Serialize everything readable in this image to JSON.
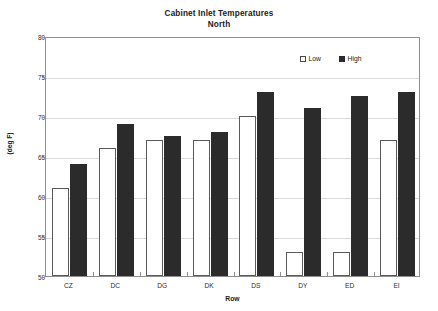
{
  "chart_data": {
    "type": "bar",
    "title": "Cabinet Inlet Temperatures",
    "subtitle": "North",
    "xlabel": "Row",
    "ylabel": "(deg F)",
    "categories": [
      "CZ",
      "DC",
      "DG",
      "DK",
      "DS",
      "DY",
      "ED",
      "EI"
    ],
    "series": [
      {
        "name": "Low",
        "color": "#ffffff",
        "values": [
          61,
          66,
          67,
          67,
          70,
          53,
          53,
          67
        ]
      },
      {
        "name": "High",
        "color": "#2b2b2b",
        "values": [
          64,
          69,
          67.5,
          68,
          73,
          71,
          72.5,
          73
        ]
      }
    ],
    "ylim": [
      50,
      80
    ],
    "yticks": [
      50,
      55,
      60,
      65,
      70,
      75,
      80
    ],
    "ytick_labels": [
      "50",
      "55",
      "60",
      "65",
      "70",
      "75",
      "80"
    ],
    "grid": true,
    "legend_position": "top-right"
  },
  "axis": {
    "y_min_label": "50",
    "y_max_label": "80"
  }
}
